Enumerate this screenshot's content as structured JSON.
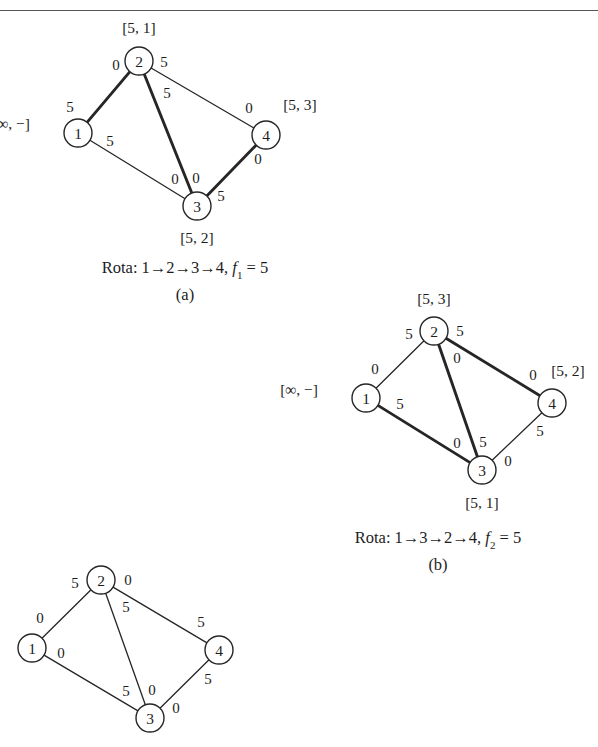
{
  "page": {
    "header_rule_present": true,
    "header_ghost_text": "",
    "background": "#ffffff",
    "ink": "#1d1d1d"
  },
  "figure": {
    "type": "flow-network-labeling-diagram",
    "panels": [
      {
        "id": "a",
        "letter": "(a)",
        "caption": "Rota: 1→2→3→4,",
        "caption_flow_var": "f",
        "caption_flow_sub": "1",
        "caption_flow_eq": "= 5",
        "nodes": [
          {
            "id": "1",
            "label": "1",
            "x": 78,
            "y": 133,
            "tag": "[∞, −]",
            "tag_x": 30,
            "tag_y": 124,
            "tag_align": "right"
          },
          {
            "id": "2",
            "label": "2",
            "x": 139,
            "y": 61,
            "tag": "[5, 1]",
            "tag_x": 139,
            "tag_y": 28,
            "tag_align": "center"
          },
          {
            "id": "3",
            "label": "3",
            "x": 197,
            "y": 206,
            "tag": "[5, 2]",
            "tag_x": 197,
            "tag_y": 238,
            "tag_align": "center"
          },
          {
            "id": "4",
            "label": "4",
            "x": 266,
            "y": 135,
            "tag": "[5, 3]",
            "tag_x": 300,
            "tag_y": 105,
            "tag_align": "center"
          }
        ],
        "edges": [
          {
            "from": "1",
            "to": "2",
            "bold": true,
            "w_from": "5",
            "w_from_x": 70,
            "w_from_y": 107,
            "w_to": "0",
            "w_to_x": 116,
            "w_to_y": 65
          },
          {
            "from": "2",
            "to": "3",
            "bold": true,
            "w_from": "5",
            "w_from_x": 167,
            "w_from_y": 93,
            "w_to": "0",
            "w_to_x": 196,
            "w_to_y": 178
          },
          {
            "from": "1",
            "to": "3",
            "bold": false,
            "w_from": "5",
            "w_from_x": 110,
            "w_from_y": 141,
            "w_to": "0",
            "w_to_x": 175,
            "w_to_y": 179
          },
          {
            "from": "2",
            "to": "4",
            "bold": false,
            "w_from": "5",
            "w_from_x": 164,
            "w_from_y": 62,
            "w_to": "0",
            "w_to_x": 249,
            "w_to_y": 108
          },
          {
            "from": "3",
            "to": "4",
            "bold": true,
            "w_from": "5",
            "w_from_x": 221,
            "w_from_y": 196,
            "w_to": "0",
            "w_to_x": 258,
            "w_to_y": 159
          }
        ]
      },
      {
        "id": "b",
        "letter": "(b)",
        "caption": "Rota: 1→3→2→4,",
        "caption_flow_var": "f",
        "caption_flow_sub": "2",
        "caption_flow_eq": "= 5",
        "nodes": [
          {
            "id": "1",
            "label": "1",
            "x": 366,
            "y": 398,
            "tag": "[∞, −]",
            "tag_x": 318,
            "tag_y": 390,
            "tag_align": "right"
          },
          {
            "id": "2",
            "label": "2",
            "x": 434,
            "y": 331,
            "tag": "[5, 3]",
            "tag_x": 434,
            "tag_y": 299,
            "tag_align": "center"
          },
          {
            "id": "3",
            "label": "3",
            "x": 482,
            "y": 470,
            "tag": "[5, 1]",
            "tag_x": 482,
            "tag_y": 503,
            "tag_align": "center"
          },
          {
            "id": "4",
            "label": "4",
            "x": 552,
            "y": 403,
            "tag": "[5, 2]",
            "tag_x": 568,
            "tag_y": 371,
            "tag_align": "center"
          }
        ],
        "edges": [
          {
            "from": "1",
            "to": "2",
            "bold": false,
            "w_from": "0",
            "w_from_x": 375,
            "w_from_y": 369,
            "w_to": "5",
            "w_to_x": 409,
            "w_to_y": 334
          },
          {
            "from": "2",
            "to": "3",
            "bold": true,
            "w_from": "0",
            "w_from_x": 457,
            "w_from_y": 358,
            "w_to": "5",
            "w_to_x": 483,
            "w_to_y": 442
          },
          {
            "from": "1",
            "to": "3",
            "bold": true,
            "w_from": "5",
            "w_from_x": 400,
            "w_from_y": 404,
            "w_to": "0",
            "w_to_x": 457,
            "w_to_y": 443
          },
          {
            "from": "2",
            "to": "4",
            "bold": true,
            "w_from": "5",
            "w_from_x": 460,
            "w_from_y": 331,
            "w_to": "0",
            "w_to_x": 533,
            "w_to_y": 375
          },
          {
            "from": "3",
            "to": "4",
            "bold": false,
            "w_from": "0",
            "w_from_x": 508,
            "w_from_y": 461,
            "w_to": "5",
            "w_to_x": 540,
            "w_to_y": 431
          }
        ]
      },
      {
        "id": "c",
        "letter": "",
        "caption": "",
        "caption_flow_var": "",
        "caption_flow_sub": "",
        "caption_flow_eq": "",
        "nodes": [
          {
            "id": "1",
            "label": "1",
            "x": 32,
            "y": 648,
            "tag": "",
            "tag_x": 0,
            "tag_y": 0,
            "tag_align": "right"
          },
          {
            "id": "2",
            "label": "2",
            "x": 101,
            "y": 580,
            "tag": "",
            "tag_x": 0,
            "tag_y": 0,
            "tag_align": "center"
          },
          {
            "id": "3",
            "label": "3",
            "x": 150,
            "y": 718,
            "tag": "",
            "tag_x": 0,
            "tag_y": 0,
            "tag_align": "center"
          },
          {
            "id": "4",
            "label": "4",
            "x": 219,
            "y": 650,
            "tag": "",
            "tag_x": 0,
            "tag_y": 0,
            "tag_align": "center"
          }
        ],
        "edges": [
          {
            "from": "1",
            "to": "2",
            "bold": false,
            "w_from": "0",
            "w_from_x": 40,
            "w_from_y": 618,
            "w_to": "5",
            "w_to_x": 75,
            "w_to_y": 583
          },
          {
            "from": "2",
            "to": "3",
            "bold": false,
            "w_from": "5",
            "w_from_x": 126,
            "w_from_y": 607,
            "w_to": "0",
            "w_to_x": 152,
            "w_to_y": 690
          },
          {
            "from": "1",
            "to": "3",
            "bold": false,
            "w_from": "0",
            "w_from_x": 61,
            "w_from_y": 653,
            "w_to": "5",
            "w_to_x": 126,
            "w_to_y": 691
          },
          {
            "from": "2",
            "to": "4",
            "bold": false,
            "w_from": "0",
            "w_from_x": 128,
            "w_from_y": 580,
            "w_to": "5",
            "w_to_x": 201,
            "w_to_y": 622
          },
          {
            "from": "3",
            "to": "4",
            "bold": false,
            "w_from": "0",
            "w_from_x": 176,
            "w_from_y": 708,
            "w_to": "5",
            "w_to_x": 208,
            "w_to_y": 679
          }
        ]
      }
    ],
    "captions": [
      {
        "panel": "a",
        "x": 185,
        "y": 258,
        "letter_x": 185,
        "letter_y": 285
      },
      {
        "panel": "b",
        "x": 438,
        "y": 528,
        "letter_x": 438,
        "letter_y": 555
      }
    ],
    "style": {
      "node_radius": 14,
      "stroke_thin": 1.3,
      "stroke_bold": 2.9,
      "stroke_node": 1.4,
      "stroke_color": "#262626",
      "node_fill": "#ffffff"
    }
  }
}
